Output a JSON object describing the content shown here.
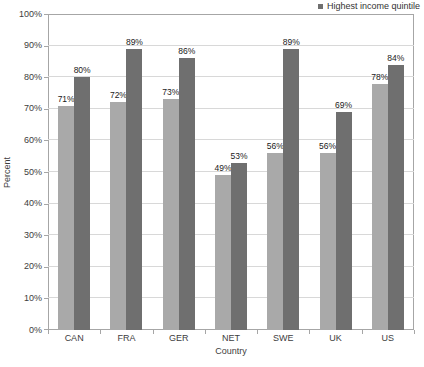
{
  "chart_data": {
    "type": "bar",
    "title": "",
    "categories": [
      "CAN",
      "FRA",
      "GER",
      "NET",
      "SWE",
      "UK",
      "US"
    ],
    "series": [
      {
        "name": "",
        "color": "#A9A9A9",
        "values": [
          71,
          72,
          73,
          49,
          56,
          56,
          78
        ]
      },
      {
        "name": "Highest income quintile",
        "color": "#6F6F6F",
        "values": [
          80,
          89,
          86,
          53,
          89,
          69,
          84
        ]
      }
    ],
    "xlabel": "Country",
    "ylabel": "Percent",
    "ylim": [
      0,
      100
    ],
    "ytick_step": 10,
    "ytick_labels": [
      "0%",
      "10%",
      "20%",
      "30%",
      "40%",
      "50%",
      "60%",
      "70%",
      "80%",
      "90%",
      "100%"
    ],
    "data_label_suffix": "%",
    "grid": true,
    "legend_position": "top-right",
    "colors": {
      "gridline": "#D8D8D8",
      "plot_border": "#A6A6A6",
      "axis_text": "#3D3D3D",
      "data_label_text": "#1A1A1A",
      "background": "#FFFFFF"
    }
  }
}
